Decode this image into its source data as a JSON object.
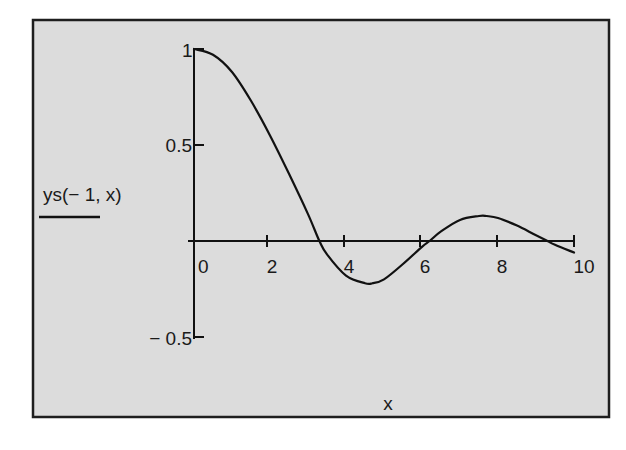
{
  "chart_data": {
    "type": "line",
    "title": "",
    "xlabel": "x",
    "ylabel": "",
    "legend": [
      "ys(− 1, x)"
    ],
    "xlim": [
      0,
      10
    ],
    "ylim": [
      -0.5,
      1
    ],
    "x_ticks": [
      "0",
      "2",
      "4",
      "6",
      "8",
      "10"
    ],
    "y_ticks": [
      "1",
      "0.5",
      "− 0.5"
    ],
    "grid": false,
    "legend_position": "left-middle",
    "series": [
      {
        "name": "ys(− 1, x)",
        "x": [
          0,
          0.5,
          1,
          1.5,
          2,
          2.5,
          3,
          3.3,
          3.5,
          4,
          4.5,
          4.7,
          5,
          5.5,
          6,
          6.2,
          6.5,
          7,
          7.5,
          7.7,
          8,
          8.5,
          9,
          9.3,
          9.5,
          10
        ],
        "values": [
          1.0,
          0.97,
          0.88,
          0.73,
          0.55,
          0.35,
          0.14,
          0.0,
          -0.07,
          -0.18,
          -0.22,
          -0.22,
          -0.2,
          -0.12,
          -0.03,
          0.0,
          0.05,
          0.11,
          0.13,
          0.13,
          0.12,
          0.08,
          0.03,
          0.0,
          -0.02,
          -0.06
        ]
      }
    ]
  },
  "plot": {
    "legend_label": "ys(− 1, x)",
    "x_axis_title": "x",
    "x_tick_labels": [
      "0",
      "2",
      "4",
      "6",
      "8",
      "10"
    ],
    "y_tick_labels": [
      "1",
      "0.5",
      "− 0.5"
    ],
    "colors": {
      "background": "#dcdcdc",
      "frame": "#1e1e1e",
      "line": "#111111",
      "page": "#ffffff"
    }
  }
}
